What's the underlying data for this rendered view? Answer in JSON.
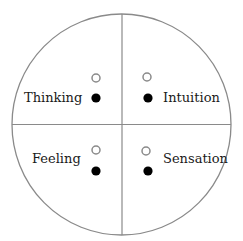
{
  "diagram": {
    "type": "quadrant-circle",
    "colors": {
      "outline": "#8a8a8a",
      "text": "#1a1a1a",
      "filled_dot": "#000000",
      "open_dot_stroke": "#8a8a8a"
    },
    "quadrants": [
      {
        "position": "top-left",
        "label": "Thinking"
      },
      {
        "position": "top-right",
        "label": "Intuition"
      },
      {
        "position": "bottom-left",
        "label": "Feeling"
      },
      {
        "position": "bottom-right",
        "label": "Sensation"
      }
    ],
    "markers_per_quadrant": [
      {
        "kind": "open-circle"
      },
      {
        "kind": "filled-circle"
      }
    ]
  }
}
